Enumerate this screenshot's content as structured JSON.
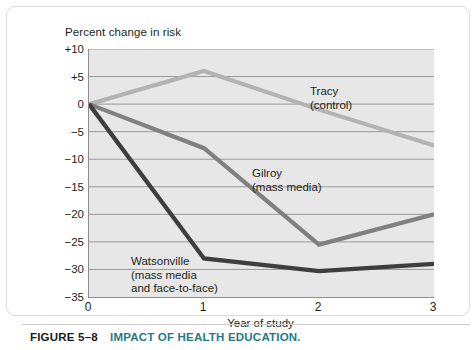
{
  "figure": {
    "number_label": "FIGURE 5–8",
    "title": "IMPACT OF HEALTH EDUCATION.",
    "number_color": "#1b1b1b",
    "title_color": "#1f7a86"
  },
  "chart_data": {
    "type": "line",
    "title": "",
    "ylabel": "Percent change in risk",
    "xlabel": "Year of study",
    "x": [
      0,
      1,
      2,
      3
    ],
    "xtick_labels": [
      "0",
      "1",
      "2",
      "3"
    ],
    "xlim": [
      0,
      3
    ],
    "ylim": [
      -35,
      10
    ],
    "ytick_values": [
      10,
      5,
      0,
      -5,
      -10,
      -15,
      -20,
      -25,
      -30,
      -35
    ],
    "ytick_labels": [
      "+10",
      "+5",
      "0",
      "−5",
      "−10",
      "−15",
      "−20",
      "−25",
      "−30",
      "−35"
    ],
    "grid": true,
    "grid_color": "#9a9a9a",
    "plot_background": "#e7e7e7",
    "legend_position": "inline-annotations",
    "series": [
      {
        "name": "Tracy",
        "sublabel": "(control)",
        "color": "#b3b3b3",
        "values": [
          0,
          6,
          -1,
          -7.5
        ]
      },
      {
        "name": "Gilroy",
        "sublabel": "(mass media)",
        "color": "#808080",
        "values": [
          0,
          -8,
          -25.5,
          -20
        ]
      },
      {
        "name": "Watsonville",
        "sublabel": "(mass media",
        "sublabel2": "and face-to-face)",
        "color": "#3e3e3e",
        "values": [
          0,
          -28,
          -30.3,
          -29
        ]
      }
    ]
  }
}
